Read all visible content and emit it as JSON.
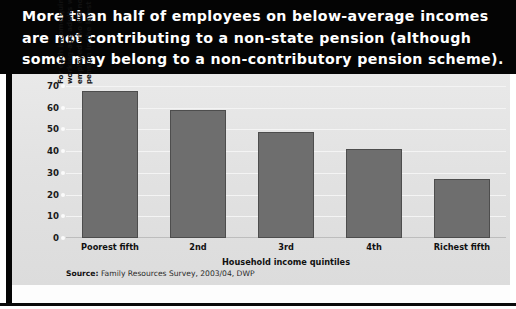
{
  "header": {
    "title_lines": [
      "More than half of employees on below-average incomes",
      "are not contributing to a non-state pension (although",
      "some may belong to a non-contributory pension scheme)."
    ]
  },
  "source": {
    "prefix": "Source:",
    "text": " Family Resources Survey, 2003/04, DWP"
  },
  "colors": {
    "header_background": "#040404",
    "panel_background": "#e4e4e4",
    "bar_fill": "#6e6e6e",
    "bar_border": "#4d4d4d",
    "gridline": "#f4f4f4",
    "text": "#111111",
    "title_text": "#ffffff"
  },
  "chart_data": {
    "type": "bar",
    "title": "",
    "categories": [
      "Poorest fifth",
      "2nd",
      "3rd",
      "4th",
      "Richest fifth"
    ],
    "values": [
      67.5,
      59,
      49,
      41,
      27
    ],
    "xlabel": "Household income quintiles",
    "ylabel": "For each income quintile, proportion of working-age adults who are currently employed who did not contribute to a pension in the latest year (per cent)",
    "ylim": [
      0,
      70
    ],
    "ytick_values": [
      0,
      10,
      20,
      30,
      40,
      50,
      60,
      70
    ],
    "ytick_labels": [
      "0",
      "10",
      "20",
      "30",
      "40",
      "50",
      "60",
      "70"
    ],
    "grid": true,
    "legend": "none"
  }
}
